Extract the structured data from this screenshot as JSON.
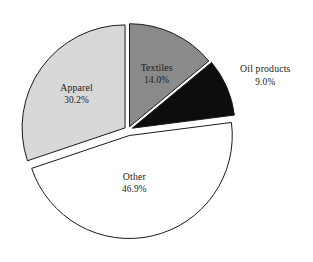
{
  "chart_data": {
    "type": "pie",
    "title": "",
    "subtitle": "",
    "xlabel": "",
    "ylabel": "",
    "legend_position": "none",
    "labels_shown": "inside-and-outside",
    "background_color": "#ffffff",
    "outline_color": "#1a1a1a",
    "categories": [
      "Textiles",
      "Oil products",
      "Other",
      "Apparel"
    ],
    "values": [
      14.0,
      9.0,
      46.9,
      30.2
    ],
    "value_suffix": "%",
    "total": 100.1,
    "start_angle_deg": 0,
    "direction": "clockwise",
    "slices": [
      {
        "name": "Textiles",
        "value": 14.0,
        "value_text": "14.0%",
        "color": "#8a8a8a",
        "explode": 0.035,
        "label_placement": "inside",
        "label_radius": 0.62,
        "label_dx": 0,
        "label_dy": 0
      },
      {
        "name": "Oil products",
        "value": 9.0,
        "value_text": "9.0%",
        "color": "#0d0d0d",
        "explode": 0.045,
        "label_placement": "outside",
        "label_radius": 1.26,
        "label_dx": 14,
        "label_dy": -6
      },
      {
        "name": "Other",
        "value": 46.9,
        "value_text": "46.9%",
        "color": "#ffffff",
        "explode": 0.055,
        "label_placement": "inside",
        "label_radius": 0.48,
        "label_dx": -6,
        "label_dy": -6
      },
      {
        "name": "Apparel",
        "value": 30.2,
        "value_text": "30.2%",
        "color": "#d8d8d8",
        "explode": 0.035,
        "label_placement": "inside",
        "label_radius": 0.58,
        "label_dx": 0,
        "label_dy": -4
      }
    ],
    "geometry": {
      "center_x": 128,
      "center_y": 130,
      "radius": 103,
      "canvas_width": 313,
      "canvas_height": 262
    }
  }
}
